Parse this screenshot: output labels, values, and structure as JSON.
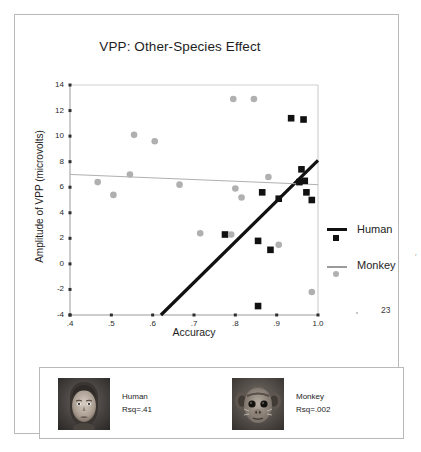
{
  "slide": {
    "page_number": "23"
  },
  "chart_data": {
    "type": "scatter",
    "title": "VPP: Other-Species Effect",
    "xlabel": "Accuracy",
    "ylabel": "Amplitude of VPP (microvolts)",
    "xlim": [
      0.4,
      1.0
    ],
    "ylim": [
      -4,
      14
    ],
    "xticks": [
      0.4,
      0.5,
      0.6,
      0.7,
      0.8,
      0.9,
      1.0
    ],
    "xticklabels": [
      ".4",
      ".5",
      ".6",
      ".7",
      ".8",
      ".9",
      "1.0"
    ],
    "yticks": [
      -4,
      -2,
      0,
      2,
      4,
      6,
      8,
      10,
      12,
      14
    ],
    "yticklabels": [
      "-4",
      "-2",
      "0",
      "2",
      "4",
      "6",
      "8",
      "10",
      "12",
      "14"
    ],
    "grid": false,
    "legend_position": "right",
    "series": [
      {
        "name": "Human",
        "marker": "square",
        "color": "#111111",
        "points": [
          [
            0.775,
            2.3
          ],
          [
            0.855,
            1.8
          ],
          [
            0.865,
            5.6
          ],
          [
            0.885,
            1.1
          ],
          [
            0.905,
            5.1
          ],
          [
            0.935,
            11.4
          ],
          [
            0.955,
            6.4
          ],
          [
            0.96,
            7.4
          ],
          [
            0.965,
            11.3
          ],
          [
            0.968,
            6.5
          ],
          [
            0.972,
            5.6
          ],
          [
            0.985,
            5.0
          ],
          [
            0.855,
            -3.3
          ]
        ],
        "fit": {
          "x0": 0.62,
          "y0": -4.0,
          "x1": 1.0,
          "y1": 8.1,
          "rsq": ".41"
        }
      },
      {
        "name": "Monkey",
        "marker": "circle",
        "color": "#b0b0b0",
        "points": [
          [
            0.467,
            6.4
          ],
          [
            0.505,
            5.4
          ],
          [
            0.545,
            7.0
          ],
          [
            0.555,
            10.1
          ],
          [
            0.605,
            9.6
          ],
          [
            0.665,
            6.2
          ],
          [
            0.715,
            2.4
          ],
          [
            0.795,
            12.9
          ],
          [
            0.8,
            5.9
          ],
          [
            0.815,
            5.2
          ],
          [
            0.845,
            12.9
          ],
          [
            0.79,
            2.3
          ],
          [
            0.88,
            6.8
          ],
          [
            0.905,
            1.5
          ],
          [
            0.985,
            -2.2
          ]
        ],
        "fit": {
          "x0": 0.4,
          "y0": 7.0,
          "x1": 1.0,
          "y1": 6.2,
          "rsq": ".002"
        }
      }
    ],
    "legend": [
      {
        "label": "Human",
        "marker": "square",
        "color": "#111111"
      },
      {
        "label": "Monkey",
        "marker": "circle",
        "color": "#b0b0b0"
      }
    ]
  },
  "bottom_panel": {
    "items": [
      {
        "label": "Human",
        "rsq": "Rsq=.41",
        "image": "human-face-thumbnail"
      },
      {
        "label": "Monkey",
        "rsq": "Rsq=.002",
        "image": "monkey-face-thumbnail"
      }
    ]
  }
}
